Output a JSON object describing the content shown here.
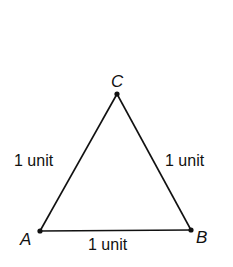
{
  "diagram": {
    "vertices": [
      {
        "name": "A",
        "x": 40,
        "y": 231
      },
      {
        "name": "B",
        "x": 191,
        "y": 230
      },
      {
        "name": "C",
        "x": 117,
        "y": 94
      }
    ],
    "sides": [
      {
        "from": "A",
        "to": "C",
        "label": "1 unit"
      },
      {
        "from": "C",
        "to": "B",
        "label": "1 unit"
      },
      {
        "from": "A",
        "to": "B",
        "label": "1 unit"
      }
    ],
    "line_color": "#111111"
  }
}
